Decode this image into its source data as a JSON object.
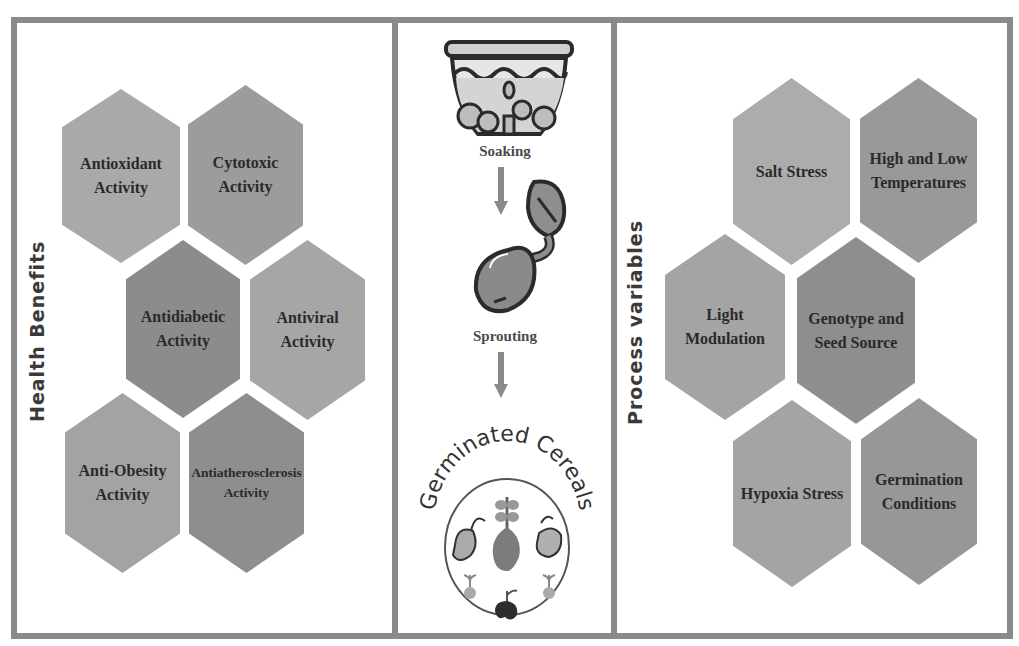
{
  "health_benefits": {
    "title": "Health Benefits",
    "items": [
      {
        "label": "Antioxidant Activity",
        "line1": "Antioxidant",
        "line2": "Activity",
        "color": "#a9a9a9"
      },
      {
        "label": "Cytotoxic Activity",
        "line1": "Cytotoxic",
        "line2": "Activity",
        "color": "#9c9c9c"
      },
      {
        "label": "Antidiabetic Activity",
        "line1": "Antidiabetic",
        "line2": "Activity",
        "color": "#8c8c8c"
      },
      {
        "label": "Antiviral Activity",
        "line1": "Antiviral",
        "line2": "Activity",
        "color": "#a6a6a6"
      },
      {
        "label": "Anti-Obesity Activity",
        "line1": "Anti-Obesity",
        "line2": "Activity",
        "color": "#a3a3a3"
      },
      {
        "label": "Antiatherosclerosis Activity",
        "line1": "Antiatherosclerosis",
        "line2": "Activity",
        "color": "#8e8e8e"
      }
    ]
  },
  "process": {
    "steps": [
      {
        "label": "Soaking",
        "icon": "bowl-icon"
      },
      {
        "label": "Sprouting",
        "icon": "sprouting-seed-icon"
      }
    ],
    "result_label": "Germinated Cereals"
  },
  "process_variables": {
    "title": "Process variables",
    "items": [
      {
        "label": "Salt Stress",
        "line1": "Salt Stress",
        "line2": "",
        "color": "#acacac"
      },
      {
        "label": "High and Low Temperatures",
        "line1": "High and Low",
        "line2": "Temperatures",
        "color": "#999999"
      },
      {
        "label": "Light Modulation",
        "line1": "Light",
        "line2": "Modulation",
        "color": "#a4a4a4"
      },
      {
        "label": "Genotype and Seed Source",
        "line1": "Genotype and",
        "line2": "Seed Source",
        "color": "#8e8e8e"
      },
      {
        "label": "Hypoxia Stress",
        "line1": "Hypoxia Stress",
        "line2": "",
        "color": "#a4a4a4"
      },
      {
        "label": "Germination Conditions",
        "line1": "Germination",
        "line2": "Conditions",
        "color": "#979797"
      }
    ]
  }
}
